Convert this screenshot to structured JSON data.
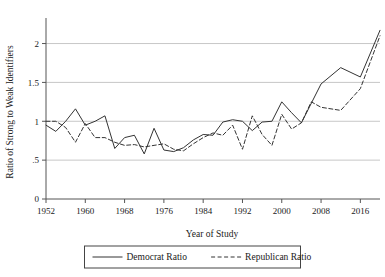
{
  "chart_data": {
    "type": "line",
    "title": "",
    "xlabel": "Year of Study",
    "ylabel": "Ratio of Strong to Weak Identifiers",
    "xlim": [
      1952,
      2020
    ],
    "ylim": [
      0,
      2.2
    ],
    "xticks": [
      1952,
      1960,
      1968,
      1976,
      1984,
      1992,
      2000,
      2008,
      2016
    ],
    "xticklabels": [
      "1952",
      "1960",
      "1968",
      "1976",
      "1984",
      "1992",
      "2000",
      "2008",
      "2016"
    ],
    "yticks": [
      0,
      0.5,
      1,
      1.5,
      2
    ],
    "yticklabels": [
      "0",
      ".5",
      "1",
      "1.5",
      "2"
    ],
    "grid": "horizontal",
    "legend_position": "below-axes",
    "series": [
      {
        "name": "Democrat Ratio",
        "style": "solid",
        "color": "#333333",
        "x": [
          1952,
          1954,
          1956,
          1958,
          1960,
          1962,
          1964,
          1966,
          1968,
          1970,
          1972,
          1974,
          1976,
          1978,
          1980,
          1982,
          1984,
          1986,
          1988,
          1990,
          1992,
          1994,
          1996,
          1998,
          2000,
          2002,
          2004,
          2008,
          2012,
          2016,
          2020
        ],
        "y": [
          0.95,
          0.87,
          1.0,
          1.16,
          0.95,
          1.0,
          1.07,
          0.65,
          0.79,
          0.82,
          0.58,
          0.91,
          0.63,
          0.61,
          0.66,
          0.76,
          0.83,
          0.82,
          0.99,
          1.02,
          1.0,
          0.88,
          0.99,
          1.0,
          1.25,
          1.11,
          0.98,
          1.48,
          1.69,
          1.57,
          2.17
        ]
      },
      {
        "name": "Republican Ratio",
        "style": "dashed",
        "color": "#333333",
        "x": [
          1952,
          1954,
          1956,
          1958,
          1960,
          1962,
          1964,
          1966,
          1968,
          1970,
          1972,
          1974,
          1976,
          1978,
          1980,
          1982,
          1984,
          1986,
          1988,
          1990,
          1992,
          1994,
          1996,
          1998,
          2000,
          2002,
          2004,
          2006,
          2008,
          2012,
          2016,
          2020
        ],
        "y": [
          1.0,
          1.0,
          0.92,
          0.73,
          0.97,
          0.79,
          0.79,
          0.73,
          0.69,
          0.7,
          0.67,
          0.69,
          0.71,
          0.64,
          0.62,
          0.71,
          0.79,
          0.85,
          0.82,
          0.95,
          0.64,
          1.07,
          0.83,
          0.69,
          1.09,
          0.9,
          0.98,
          1.25,
          1.18,
          1.14,
          1.42,
          2.1
        ]
      }
    ]
  },
  "legend": {
    "items": [
      {
        "label": "Democrat Ratio",
        "style": "solid"
      },
      {
        "label": "Republican Ratio",
        "style": "dashed"
      }
    ]
  }
}
